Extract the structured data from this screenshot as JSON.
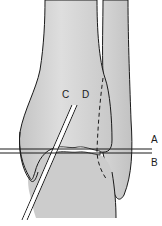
{
  "diagram": {
    "type": "anatomical line drawing",
    "labels": {
      "C": "C",
      "D": "D",
      "A": "A",
      "B": "B"
    },
    "colors": {
      "bone_fill": "#cfcfcf",
      "bone_fill_light": "#e2e2e2",
      "outline": "#1a1a1a",
      "background": "#ffffff",
      "joint_space": "#ffffff"
    }
  }
}
